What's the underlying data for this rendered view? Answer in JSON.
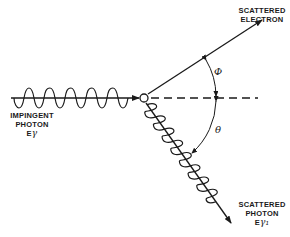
{
  "diagram": {
    "type": "compton-scattering",
    "labels": {
      "electron_line1": "SCATTERED",
      "electron_line2": "ELECTRON",
      "impingent_line1": "IMPINGENT",
      "impingent_line2": "PHOTON",
      "impingent_energy": "E",
      "impingent_energy_sub": "γ",
      "scattered_photon_line1": "SCATTERED",
      "scattered_photon_line2": "PHOTON",
      "scattered_energy": "E",
      "scattered_energy_sub": "γ₁",
      "electron_angle": "Φ",
      "photon_angle": "θ"
    },
    "nodes": [
      {
        "id": "impingent-photon",
        "label": "IMPINGENT PHOTON Eγ"
      },
      {
        "id": "scattering-center",
        "label": ""
      },
      {
        "id": "scattered-electron",
        "label": "SCATTERED ELECTRON"
      },
      {
        "id": "scattered-photon",
        "label": "SCATTERED PHOTON Eγ1"
      }
    ],
    "edges": [
      {
        "from": "impingent-photon",
        "to": "scattering-center",
        "style": "wavy-arrow"
      },
      {
        "from": "scattering-center",
        "to": "scattered-electron",
        "style": "arrow"
      },
      {
        "from": "scattering-center",
        "to": "scattered-photon",
        "style": "wavy-arrow"
      },
      {
        "from": "scattering-center",
        "to": "reference-axis",
        "style": "dashed"
      }
    ],
    "angles": [
      {
        "symbol": "Φ",
        "between": [
          "scattered-electron",
          "reference-axis"
        ]
      },
      {
        "symbol": "θ",
        "between": [
          "reference-axis",
          "scattered-photon"
        ]
      }
    ],
    "colors": {
      "ink": "#1a1a1a",
      "background": "#ffffff"
    }
  }
}
